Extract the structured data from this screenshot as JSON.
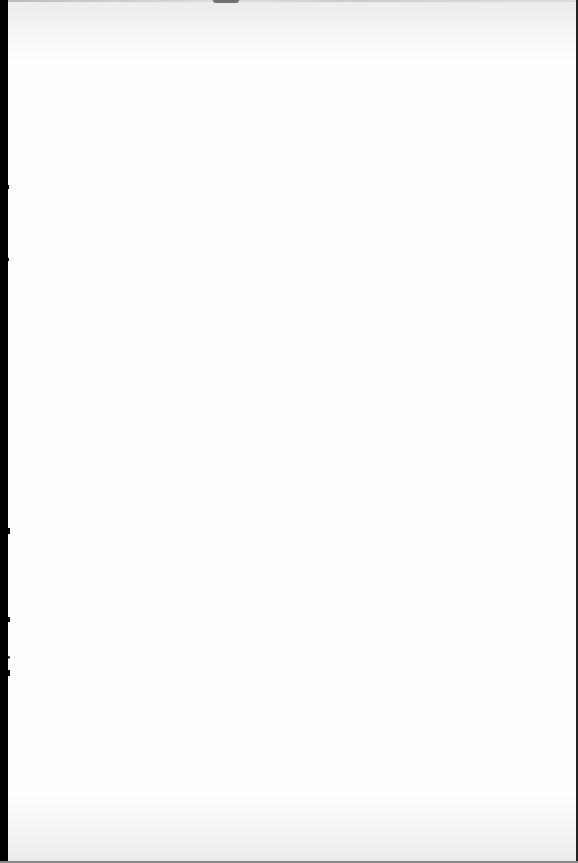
{
  "document": {
    "type": "blank-scanned-page",
    "text": "",
    "colors": {
      "page": "#fefefe",
      "binding_edge": "#000000",
      "right_edge": "#222222"
    }
  }
}
